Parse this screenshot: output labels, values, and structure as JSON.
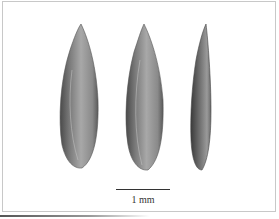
{
  "figure": {
    "specimens": [
      {
        "view": "left seed"
      },
      {
        "view": "middle seed"
      },
      {
        "view": "right seed (lateral)"
      }
    ],
    "scale_bar": {
      "label": "1 mm"
    }
  }
}
